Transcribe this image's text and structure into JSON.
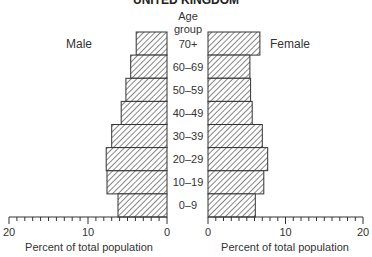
{
  "chart_data": {
    "type": "bar",
    "orientation": "horizontal",
    "variant": "population-pyramid",
    "title": "UNITED KINGDOM",
    "category_axis_title": [
      "Age",
      "group"
    ],
    "categories": [
      "70+",
      "60–69",
      "50–59",
      "40–49",
      "30–39",
      "20–29",
      "10–19",
      "0–9"
    ],
    "series": [
      {
        "name": "Male",
        "side": "left",
        "values": [
          3.9,
          4.6,
          5.2,
          5.8,
          7.0,
          7.7,
          7.6,
          6.2
        ]
      },
      {
        "name": "Female",
        "side": "right",
        "values": [
          6.7,
          5.4,
          5.5,
          5.7,
          7.0,
          7.7,
          7.2,
          6.1
        ]
      }
    ],
    "xlabel": "Percent of total population",
    "xlim": [
      0,
      20
    ],
    "x_major_ticks": [
      0,
      10,
      20
    ],
    "x_tick_labels_left": [
      "20",
      "10",
      "0"
    ],
    "x_tick_labels_right": [
      "0",
      "10",
      "20"
    ],
    "x_minor_tick_step": 1,
    "fill": "diagonal hatching",
    "bar_color": "#ffffff",
    "stroke_color": "#333333",
    "grid": false
  }
}
